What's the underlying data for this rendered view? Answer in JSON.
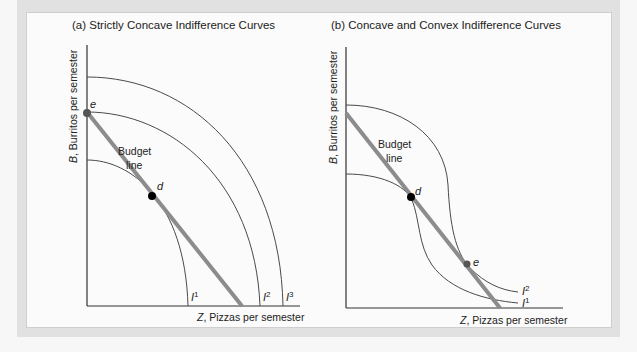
{
  "panels": [
    {
      "id": "a",
      "title": "(a) Strictly Concave Indifference Curves",
      "ylabel_var": "B",
      "ylabel_rest": ", Burritos per semester",
      "xlabel_var": "Z",
      "xlabel_rest": ", Pizzas per semester",
      "budget_label_1": "Budget",
      "budget_label_2": "line",
      "points": {
        "e": "e",
        "d": "d"
      },
      "curves": [
        {
          "base": "I",
          "sup": "1"
        },
        {
          "base": "I",
          "sup": "2"
        },
        {
          "base": "I",
          "sup": "3"
        }
      ]
    },
    {
      "id": "b",
      "title": "(b) Concave and Convex Indifference Curves",
      "ylabel_var": "B",
      "ylabel_rest": ", Burritos per semester",
      "xlabel_var": "Z",
      "xlabel_rest": ", Pizzas per semester",
      "budget_label_1": "Budget",
      "budget_label_2": "line",
      "points": {
        "e": "e",
        "d": "d"
      },
      "curves": [
        {
          "base": "I",
          "sup": "2"
        },
        {
          "base": "I",
          "sup": "1"
        }
      ]
    }
  ],
  "colors": {
    "frame": "#e1e1e1",
    "panel": "#fbfbfb",
    "budget_line": "#8c8c8c",
    "curve": "#4a4a4a",
    "point_d": "#000000",
    "point_e": "#555555"
  }
}
